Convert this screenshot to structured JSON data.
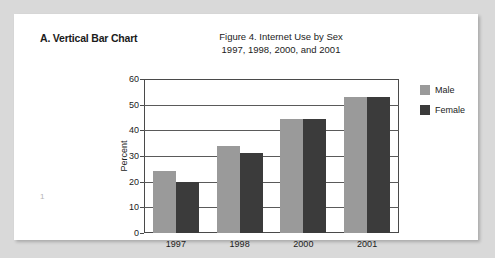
{
  "page": {
    "number": "1",
    "section_label": "A. Vertical Bar Chart"
  },
  "chart_data": {
    "type": "bar",
    "title": "Figure 4. Internet Use by Sex",
    "subtitle": "1997, 1998, 2000, and 2001",
    "title_line1": "Figure 4. Internet Use by Sex",
    "title_line2": "1997, 1998, 2000, and 2001",
    "xlabel": "",
    "ylabel": "Percent",
    "ylim": [
      0,
      60
    ],
    "ytick_step": 10,
    "yticks": [
      0,
      10,
      20,
      30,
      40,
      50,
      60
    ],
    "ytick_labels": [
      "0",
      "10",
      "20",
      "30",
      "40",
      "50",
      "60"
    ],
    "categories": [
      "1997",
      "1998",
      "2000",
      "2001"
    ],
    "grid": true,
    "grid_axis": "y",
    "legend_position": "right",
    "series": [
      {
        "name": "Male",
        "color": "#9a9a9a",
        "values": [
          24,
          34,
          44.5,
          53
        ]
      },
      {
        "name": "Female",
        "color": "#3b3b3b",
        "values": [
          20,
          31,
          44.5,
          53
        ]
      }
    ]
  }
}
